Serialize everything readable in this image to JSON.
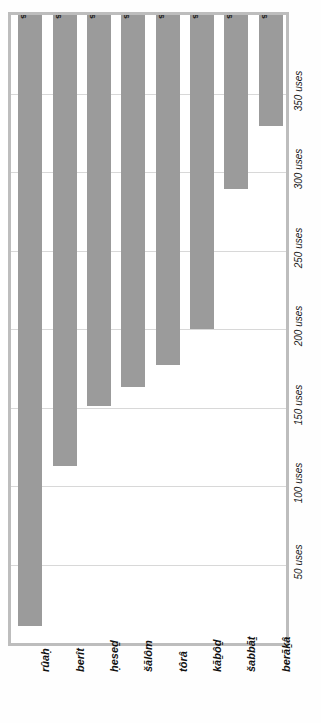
{
  "chart_data": {
    "type": "bar",
    "title": "",
    "subtitle": "",
    "xlabel": "",
    "ylabel": "uses",
    "orientation": "vertical-rotated",
    "grid": true,
    "legend": "none",
    "ylim": [
      0,
      400
    ],
    "tick_interval": 50,
    "categories": [
      "rûaḥ",
      "berît",
      "ḥeseḏ",
      "šālôm",
      "tôrâ",
      "kāḇôḏ",
      "šabbāṯ",
      "berāḵâ"
    ],
    "values": [
      389,
      287,
      249,
      237,
      223,
      200,
      111,
      71
    ],
    "value_labels": [
      "389 uses",
      "287 uses",
      "249 uses",
      "237 uses",
      "223 uses",
      "200 uses",
      "111 uses",
      "71 uses"
    ],
    "tick_values": [
      50,
      100,
      150,
      200,
      250,
      300,
      350
    ],
    "tick_labels": [
      "50 uses",
      "100 uses",
      "150 uses",
      "200 uses",
      "250 uses",
      "300 uses",
      "350 uses"
    ],
    "series": [
      {
        "name": "uses",
        "values": [
          389,
          287,
          249,
          237,
          223,
          200,
          111,
          71
        ]
      }
    ],
    "colors": {
      "bar": "#9b9b9b",
      "plot_background": "#ffffff",
      "frame_border": "#bdbdbd",
      "gridline": "#d8d8d8",
      "text": "#111111",
      "page_background": "#fefefe"
    }
  }
}
